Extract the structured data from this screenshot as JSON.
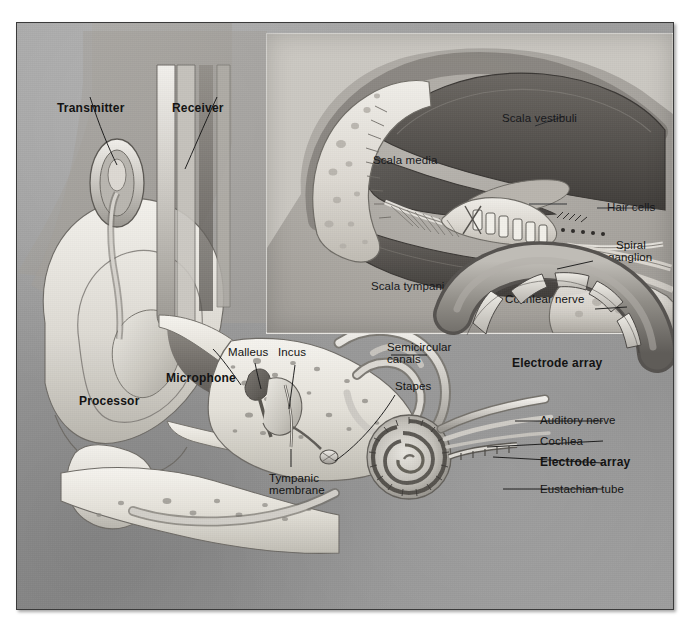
{
  "figure": {
    "background_color": "#9c9c9c",
    "frame_color": "#3a3a3a",
    "inset_background": "#cecbc6"
  },
  "inset_labels": {
    "scala_vestibuli": "Scala vestibuli",
    "scala_media": "Scala media",
    "scala_tympani": "Scala tympani",
    "hair_cells": "Hair cells",
    "spiral_ganglion_line1": "Spiral",
    "spiral_ganglion_line2": "ganglion",
    "cochlear_nerve": "Cochlear nerve",
    "electrode_array": "Electrode array"
  },
  "main_labels": {
    "transmitter": "Transmitter",
    "receiver": "Receiver",
    "processor": "Processor",
    "microphone": "Microphone",
    "malleus": "Malleus",
    "incus": "Incus",
    "stapes": "Stapes",
    "semicircular_line1": "Semicircular",
    "semicircular_line2": "canals",
    "auditory_nerve": "Auditory nerve",
    "cochlea": "Cochlea",
    "electrode_array": "Electrode array",
    "tympanic_line1": "Tympanic",
    "tympanic_line2": "membrane",
    "eustachian_tube": "Eustachian tube"
  }
}
